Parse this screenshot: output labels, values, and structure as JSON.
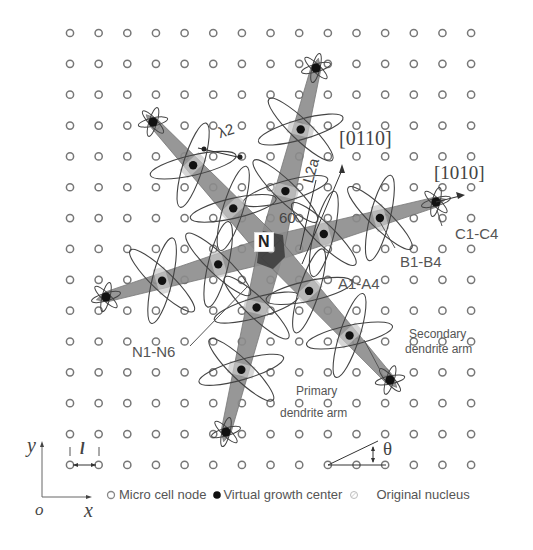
{
  "figure": {
    "grid": {
      "columns": 15,
      "rows": 15,
      "x0": 70,
      "y0": 33,
      "dx": 28.65,
      "dy": 30.85,
      "node_color": "#777777"
    },
    "nucleus_center": {
      "x": 271,
      "y": 249
    },
    "primary_arm_tips": [
      {
        "name": "right",
        "x": 436,
        "y": 202
      },
      {
        "name": "upper",
        "x": 316,
        "y": 68
      },
      {
        "name": "upper-left",
        "x": 153,
        "y": 122
      },
      {
        "name": "left",
        "x": 106,
        "y": 297
      },
      {
        "name": "lower",
        "x": 226,
        "y": 432
      },
      {
        "name": "lower-right",
        "x": 390,
        "y": 380
      }
    ],
    "colors": {
      "arm_fill": "#8c8c8c",
      "arm_light": "#c8c8c8",
      "center_dark": "#3a3a3a",
      "ellipse_stroke": "#444444",
      "text": "#555555"
    }
  },
  "labels": {
    "nucleus": "N",
    "lambda2": "λ2",
    "l2a": "L2a",
    "angle60": "60",
    "dir_0110": "[01̄ 1̄ 0]",
    "dir_0110_plain": "[0110]",
    "dir_1010": "[1010]",
    "c1_c4": "C1-C4",
    "b1_b4": "B1-B4",
    "a1_a4": "A1-A4",
    "n1_n6": "N1-N6",
    "secondary_line1": "Secondary",
    "secondary_line2": "dendrite arm",
    "primary_line1": "Primary",
    "primary_line2": "dendrite arm",
    "theta": "θ",
    "spacing": "l",
    "axis_y": "y",
    "axis_x": "x",
    "origin": "o"
  },
  "legend": {
    "items": [
      {
        "symbol": "open-circle",
        "label": "Micro cell node"
      },
      {
        "symbol": "filled-circle",
        "label": "Virtual growth center"
      },
      {
        "symbol": "hatched-circle",
        "label": "Original nucleus"
      }
    ]
  }
}
